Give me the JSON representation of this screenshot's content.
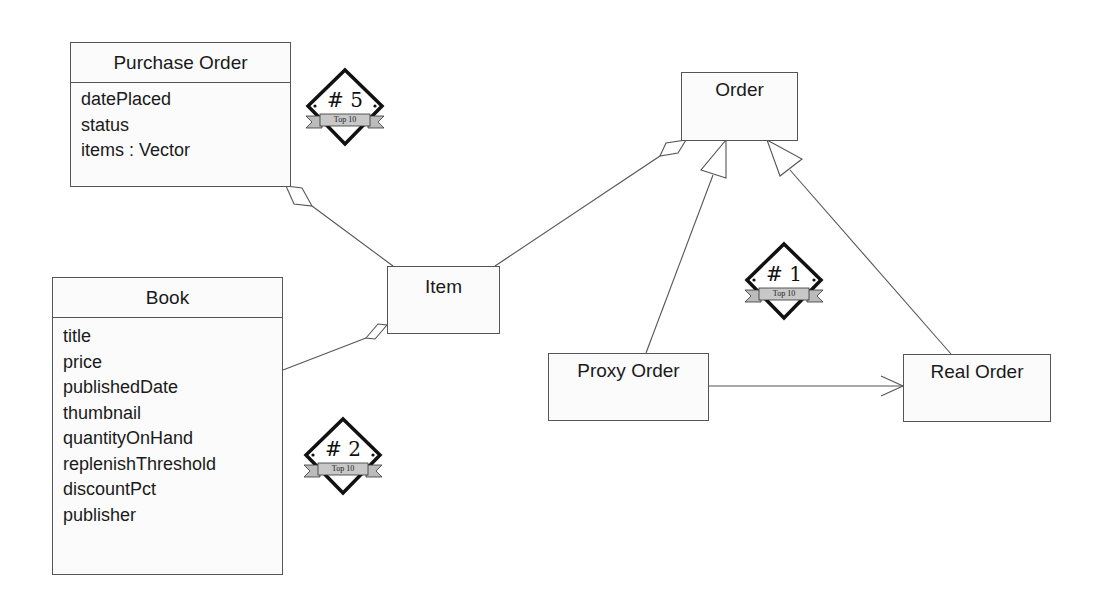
{
  "diagram": {
    "type": "UML class diagram",
    "classes": {
      "purchase_order": {
        "name": "Purchase Order",
        "attributes": [
          "datePlaced",
          "status",
          "items : Vector"
        ]
      },
      "book": {
        "name": "Book",
        "attributes": [
          "title",
          "price",
          "publishedDate",
          "thumbnail",
          "quantityOnHand",
          "replenishThreshold",
          "discountPct",
          "publisher"
        ]
      },
      "item": {
        "name": "Item"
      },
      "order": {
        "name": "Order"
      },
      "proxy_order": {
        "name": "Proxy Order"
      },
      "real_order": {
        "name": "Real Order"
      }
    },
    "relationships": [
      {
        "from": "Purchase Order",
        "to": "Item",
        "kind": "aggregation"
      },
      {
        "from": "Item",
        "to": "Book",
        "kind": "aggregation"
      },
      {
        "from": "Order",
        "to": "Item",
        "kind": "aggregation"
      },
      {
        "from": "Proxy Order",
        "to": "Order",
        "kind": "generalization"
      },
      {
        "from": "Real Order",
        "to": "Order",
        "kind": "generalization"
      },
      {
        "from": "Proxy Order",
        "to": "Real Order",
        "kind": "association"
      }
    ],
    "badges": [
      {
        "rank": "# 5",
        "label": "Top 10"
      },
      {
        "rank": "# 1",
        "label": "Top 10"
      },
      {
        "rank": "# 2",
        "label": "Top 10"
      }
    ]
  },
  "colors": {
    "line": "#555555",
    "box_fill": "#fbfbfb",
    "badge_ribbon": "#c8c8c8"
  }
}
